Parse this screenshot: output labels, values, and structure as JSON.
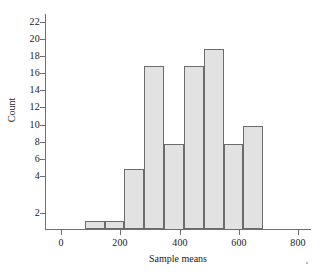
{
  "chart_data": {
    "type": "bar",
    "title": "",
    "xlabel": "Sample means",
    "ylabel": "Count",
    "grid": false,
    "legend": null,
    "xlim": [
      0,
      800
    ],
    "ylim": [
      0,
      22
    ],
    "xticks": [
      "0",
      "200",
      "400",
      "600",
      "800"
    ],
    "xtick_values": [
      0,
      200,
      400,
      600,
      800
    ],
    "yticks": [
      "2",
      "4",
      "6",
      "8",
      "10",
      "12",
      "14",
      "16",
      "18",
      "20",
      "22"
    ],
    "ytick_values": [
      2,
      4,
      6,
      8,
      10,
      12,
      14,
      16,
      18,
      20,
      22
    ],
    "bin_width": 67,
    "bin_edges": [
      80,
      147,
      214,
      281,
      348,
      415,
      482,
      549,
      616,
      683
    ],
    "categories": [
      "80-147",
      "147-214",
      "214-281",
      "281-348",
      "348-415",
      "415-482",
      "482-549",
      "549-616",
      "616-683"
    ],
    "values": [
      1,
      1,
      7,
      19,
      10,
      19,
      21,
      10,
      12
    ],
    "bar_fill_color": "#e2e2e2",
    "bar_edge_color": "#6b6b6b",
    "axis_color": "#6f6f6f"
  }
}
